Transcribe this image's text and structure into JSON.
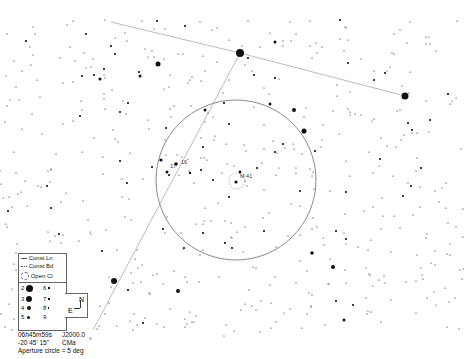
{
  "chart": {
    "type": "star-chart",
    "center_ra": "06h45m59s",
    "center_dec": "-20 45' 15\"",
    "epoch": "J2000.0",
    "constellation": "CMa",
    "aperture_text": "Aperture circle = 5 deg"
  },
  "legend": {
    "items": [
      {
        "label": "Const Ln",
        "symbol": "line"
      },
      {
        "label": "Const Bd",
        "symbol": "dotted-line"
      },
      {
        "label": "Open Cl",
        "symbol": "dashed-circle"
      }
    ],
    "magnitudes": [
      "2",
      "3",
      "4",
      "5",
      "6",
      "7",
      "8",
      "9"
    ]
  },
  "compass": {
    "north": "N",
    "east": "E"
  },
  "labels": {
    "cluster": "M 41",
    "star_16": "16",
    "star_17": "17"
  },
  "colors": {
    "background": "#ffffff",
    "stars": "#111111",
    "constellation_line": "#bbbbbb",
    "aperture_circle": "#999999"
  }
}
